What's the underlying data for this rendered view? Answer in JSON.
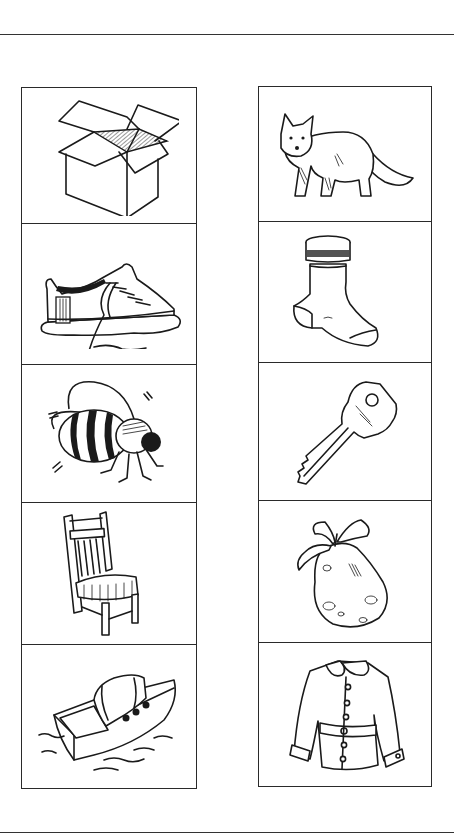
{
  "worksheet": {
    "left_column": {
      "items": [
        {
          "label": "box",
          "icon": "open-box-icon"
        },
        {
          "label": "shoe",
          "icon": "sneaker-icon"
        },
        {
          "label": "bee",
          "icon": "bee-icon"
        },
        {
          "label": "chair",
          "icon": "chair-icon"
        },
        {
          "label": "boat",
          "icon": "boat-icon"
        }
      ]
    },
    "right_column": {
      "items": [
        {
          "label": "fox",
          "icon": "fox-icon"
        },
        {
          "label": "sock",
          "icon": "sock-icon"
        },
        {
          "label": "key",
          "icon": "key-icon"
        },
        {
          "label": "pear",
          "icon": "pear-icon"
        },
        {
          "label": "coat",
          "icon": "coat-icon"
        }
      ]
    },
    "colors": {
      "line": "#1a1a1a",
      "border": "#2a2a2a",
      "background": "#ffffff"
    }
  }
}
